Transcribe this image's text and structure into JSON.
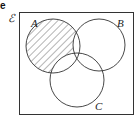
{
  "question_marker": "e",
  "universal_set_label": "ℰ",
  "sets": [
    {
      "label": "A",
      "shaded": "A only (excluding B and C)"
    },
    {
      "label": "B"
    },
    {
      "label": "C"
    }
  ],
  "colors": {
    "stroke": "#333333",
    "hatch": "#444444",
    "background": "#ffffff"
  }
}
